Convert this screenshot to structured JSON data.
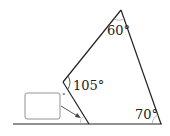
{
  "diagram": {
    "type": "geometry",
    "angles": [
      {
        "label": "60°",
        "vertex": "top"
      },
      {
        "label": "105°",
        "vertex": "left-reflex"
      },
      {
        "label": "70°",
        "vertex": "bottom-right"
      }
    ],
    "unknown_angle": {
      "box_label": "",
      "degree_symbol": "°",
      "vertex": "bottom-middle"
    },
    "colors": {
      "line": "#222222",
      "box_border": "#888888"
    }
  }
}
